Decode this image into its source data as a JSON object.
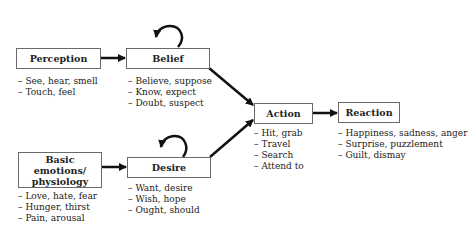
{
  "nodes": {
    "perception": {
      "label": "Perception",
      "items": [
        "See, hear, smell",
        "Touch, feel"
      ]
    },
    "belief": {
      "label": "Belief",
      "items": [
        "Believe, suppose",
        "Know, expect",
        "Doubt, suspect"
      ]
    },
    "basic_emotions": {
      "label": "Basic emotions/ physiology",
      "items": [
        "Love, hate, fear",
        "Hunger, thirst",
        "Pain, arousal"
      ]
    },
    "desire": {
      "label": "Desire",
      "items": [
        "Want, desire",
        "Wish, hope",
        "Ought, should"
      ]
    },
    "action": {
      "label": "Action",
      "items": [
        "Hit, grab",
        "Travel",
        "Search",
        "Attend to"
      ]
    },
    "reaction": {
      "label": "Reaction",
      "items": [
        "Happiness, sadness, anger",
        "Surprise, puzzlement",
        "Guilt, dismay"
      ]
    }
  },
  "edges": [
    {
      "from": "Perception",
      "to": "Belief"
    },
    {
      "from": "Belief",
      "to": "Belief",
      "type": "self-loop"
    },
    {
      "from": "Basic emotions/ physiology",
      "to": "Desire"
    },
    {
      "from": "Desire",
      "to": "Desire",
      "type": "self-loop"
    },
    {
      "from": "Belief",
      "to": "Action"
    },
    {
      "from": "Desire",
      "to": "Action"
    },
    {
      "from": "Action",
      "to": "Reaction"
    }
  ]
}
